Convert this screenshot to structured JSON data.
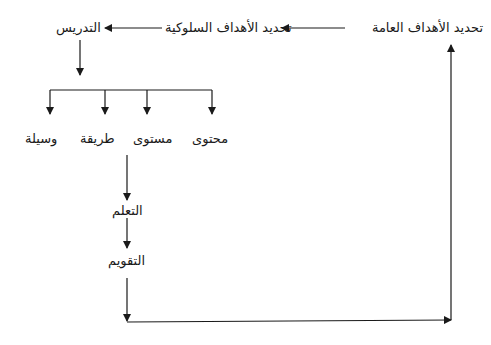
{
  "diagram": {
    "type": "flowchart",
    "direction": "rtl",
    "line_color": "#1a1a1a",
    "nodes": {
      "general_objectives": "تحديد الأهداف العامة",
      "behavioral_objectives": "تحديد الأهداف السلوكية",
      "teaching": "التدريس",
      "content": "محتوى",
      "level": "مستوى",
      "method": "طريقة",
      "medium": "وسيلة",
      "learning": "التعلم",
      "evaluation": "التقويم"
    },
    "edges": [
      {
        "from": "general_objectives",
        "to": "behavioral_objectives"
      },
      {
        "from": "behavioral_objectives",
        "to": "teaching"
      },
      {
        "from": "teaching",
        "to": [
          "content",
          "level",
          "method",
          "medium"
        ]
      },
      {
        "from": "level",
        "to": "learning"
      },
      {
        "from": "learning",
        "to": "evaluation"
      },
      {
        "from": "evaluation",
        "to": "general_objectives",
        "note": "feedback loop"
      }
    ]
  }
}
